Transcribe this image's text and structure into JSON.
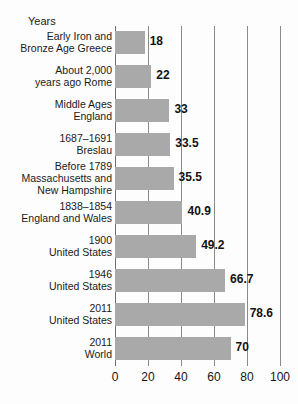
{
  "chart_data": {
    "type": "bar",
    "orientation": "horizontal",
    "title": "",
    "xlabel": "",
    "ylabel": "Years",
    "axis_title": "Years",
    "categories": [
      "Early Iron and Bronze Age Greece",
      "About 2,000 years ago Rome",
      "Middle Ages England",
      "1687–1691 Breslau",
      "Before 1789 Massachusetts and New Hampshire",
      "1838–1854 England and Wales",
      "1900 United States",
      "1946 United States",
      "2011 United States",
      "2011 World"
    ],
    "category_lines": [
      [
        "Early Iron and",
        "Bronze Age Greece"
      ],
      [
        "About 2,000",
        "years ago Rome"
      ],
      [
        "Middle Ages",
        "England"
      ],
      [
        "1687–1691",
        "Breslau"
      ],
      [
        "Before 1789",
        "Massachusetts and",
        "New Hampshire"
      ],
      [
        "1838–1854",
        "England and Wales"
      ],
      [
        "1900",
        "United States"
      ],
      [
        "1946",
        "United States"
      ],
      [
        "2011",
        "United States"
      ],
      [
        "2011",
        "World"
      ]
    ],
    "values": [
      18,
      22,
      33,
      33.5,
      35.5,
      40.9,
      49.2,
      66.7,
      78.6,
      70
    ],
    "value_labels": [
      "18",
      "22",
      "33",
      "33.5",
      "35.5",
      "40.9",
      "49.2",
      "66.7",
      "78.6",
      "70"
    ],
    "xlim": [
      0,
      100
    ],
    "xticks": [
      0,
      20,
      40,
      60,
      80,
      100
    ],
    "xtick_labels": [
      "0",
      "20",
      "40",
      "60",
      "80",
      "100"
    ],
    "grid": true,
    "grid_axis": "x",
    "legend": null,
    "bar_color": "#a9a9a9",
    "grid_color": "#8a8a8a",
    "text_color": "#1a1a1a",
    "background_color": "#fdfdfd"
  }
}
